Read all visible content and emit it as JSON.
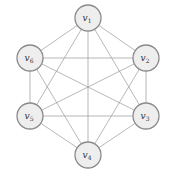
{
  "diagram": {
    "type": "complete-graph",
    "name": "K6",
    "node_radius": 13,
    "colors": {
      "background": "#ffffff",
      "node_fill": "#eeeeee",
      "node_stroke": "#8a8a8a",
      "edge": "#9a9a9a",
      "label": "#333333"
    },
    "nodes": [
      {
        "id": "v1",
        "base": "v",
        "sub": "1",
        "x": 88,
        "y": 18
      },
      {
        "id": "v2",
        "base": "v",
        "sub": "2",
        "x": 146,
        "y": 58
      },
      {
        "id": "v3",
        "base": "v",
        "sub": "3",
        "x": 146,
        "y": 116
      },
      {
        "id": "v4",
        "base": "v",
        "sub": "4",
        "x": 88,
        "y": 155
      },
      {
        "id": "v5",
        "base": "v",
        "sub": "5",
        "x": 30,
        "y": 116
      },
      {
        "id": "v6",
        "base": "v",
        "sub": "6",
        "x": 30,
        "y": 58
      }
    ],
    "edges": [
      [
        "v1",
        "v2"
      ],
      [
        "v1",
        "v3"
      ],
      [
        "v1",
        "v4"
      ],
      [
        "v1",
        "v5"
      ],
      [
        "v1",
        "v6"
      ],
      [
        "v2",
        "v3"
      ],
      [
        "v2",
        "v4"
      ],
      [
        "v2",
        "v5"
      ],
      [
        "v2",
        "v6"
      ],
      [
        "v3",
        "v4"
      ],
      [
        "v3",
        "v5"
      ],
      [
        "v3",
        "v6"
      ],
      [
        "v4",
        "v5"
      ],
      [
        "v4",
        "v6"
      ],
      [
        "v5",
        "v6"
      ]
    ]
  }
}
